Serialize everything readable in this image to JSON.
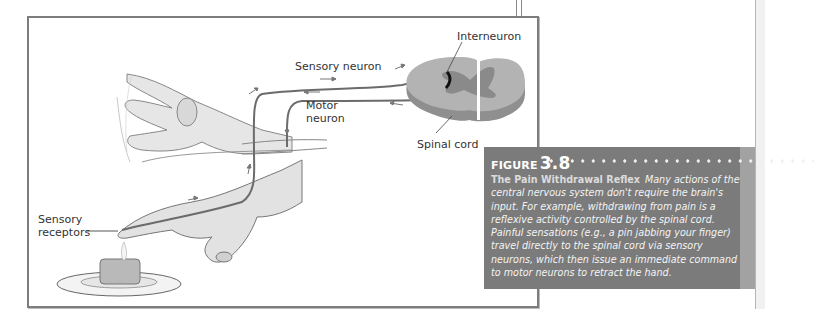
{
  "figure": {
    "labels": {
      "interneuron": "Interneuron",
      "sensory_neuron": "Sensory neuron",
      "motor_neuron_line1": "Motor",
      "motor_neuron_line2": "neuron",
      "spinal_cord": "Spinal cord",
      "sensory_receptors_line1": "Sensory",
      "sensory_receptors_line2": "receptors"
    },
    "illustration": {
      "subject": "hand touching candle flame with reflex withdrawal",
      "elements": [
        "hand-reaching",
        "hand-withdrawn",
        "candle-on-saucer",
        "spinal-cord-cross-section",
        "sensory-neuron-path",
        "motor-neuron-path",
        "interneuron"
      ]
    }
  },
  "caption": {
    "figure_word": "FIGURE",
    "figure_number": "3.8",
    "title": "The Pain Withdrawal Reflex",
    "body": "Many actions of the central nervous system don't require the brain's input. For example, withdrawing from pain is a reflexive activity controlled by the spinal cord. Painful sensations (e.g., a pin jabbing your finger) travel directly to the spinal cord via sensory neurons, which then issue an immediate command to motor neurons to retract the hand."
  },
  "colors": {
    "caption_bg": "#7b7b7b",
    "frame_border": "#7d7d7d",
    "neuron_line": "#6e6e6e",
    "spinal_cord": "#a5a5a5"
  }
}
